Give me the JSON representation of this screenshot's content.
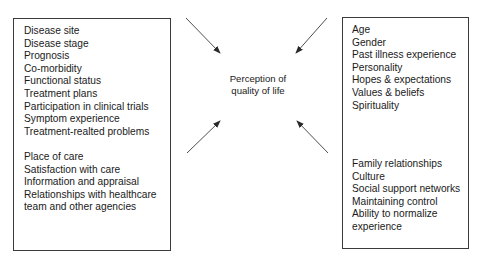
{
  "center": {
    "line1": "Perception of",
    "line2": "quality of life"
  },
  "left_box": {
    "group1": [
      "Disease site",
      "Disease stage",
      "Prognosis",
      "Co-morbidity",
      "Functional status",
      "Treatment plans",
      "Participation in clinical trials",
      "Symptom experience",
      "Treatment-realted problems"
    ],
    "group2": [
      "Place of care",
      "Satisfaction with care",
      "Information and appraisal",
      "Relationships with healthcare",
      "team and other agencies"
    ]
  },
  "right_box": {
    "group1": [
      "Age",
      "Gender",
      "Past illness experience",
      "Personality",
      "Hopes & expectations",
      "Values & beliefs",
      "Spirituality"
    ],
    "group2": [
      "Family relationships",
      "Culture",
      "Social support networks",
      "Maintaining control",
      "Ability to normalize",
      "experience"
    ]
  },
  "colors": {
    "line": "#3a3a3a",
    "text": "#1a1a1a",
    "background": "#ffffff"
  }
}
